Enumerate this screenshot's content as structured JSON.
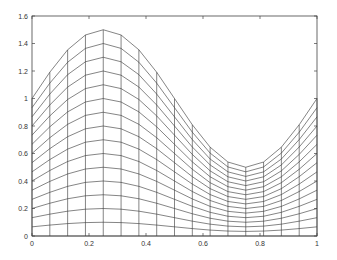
{
  "chart_data": {
    "type": "line",
    "title": "",
    "xlabel": "",
    "ylabel": "",
    "xlim": [
      0,
      1
    ],
    "ylim": [
      0,
      1.6
    ],
    "grid": false,
    "legend": null,
    "x": [
      0,
      0.0625,
      0.125,
      0.1875,
      0.25,
      0.3125,
      0.375,
      0.4375,
      0.5,
      0.5625,
      0.625,
      0.6875,
      0.75,
      0.8125,
      0.875,
      0.9375,
      1
    ],
    "levels": 16,
    "amplitude": 0.5,
    "top_curve_values": [
      1.0,
      1.191,
      1.354,
      1.462,
      1.5,
      1.462,
      1.354,
      1.191,
      1.0,
      0.809,
      0.646,
      0.538,
      0.5,
      0.538,
      0.646,
      0.809,
      1.0
    ],
    "xticks": [
      "0",
      "0.2",
      "0.4",
      "0.6",
      "0.8",
      "1"
    ],
    "xtick_values": [
      0,
      0.2,
      0.4,
      0.6,
      0.8,
      1
    ],
    "yticks": [
      "0",
      "0.2",
      "0.4",
      "0.6",
      "0.8",
      "1",
      "1.2",
      "1.4",
      "1.6"
    ],
    "ytick_values": [
      0,
      0.2,
      0.4,
      0.6,
      0.8,
      1,
      1.2,
      1.4,
      1.6
    ],
    "line_color": "#333333"
  }
}
